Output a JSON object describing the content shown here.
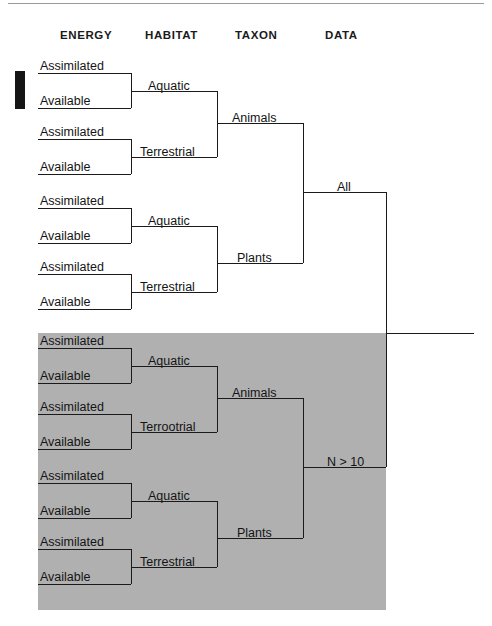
{
  "figure": {
    "width": 492,
    "height": 626,
    "shade_color": "#b0b0b0",
    "line_color": "#1a1a1a",
    "background": "#ffffff"
  },
  "headers": [
    {
      "label": "ENERGY",
      "x": 60,
      "y": 29
    },
    {
      "label": "HABITAT",
      "x": 145,
      "y": 29
    },
    {
      "label": "TAXON",
      "x": 235,
      "y": 29
    },
    {
      "label": "DATA",
      "x": 325,
      "y": 29
    }
  ],
  "marker": {
    "name": "highlight-bar",
    "x": 15,
    "y": 71,
    "w": 10,
    "h": 38
  },
  "shaded_region": {
    "x": 38,
    "y": 333,
    "w": 348,
    "h": 277
  },
  "tree": {
    "root": {
      "label": "All",
      "data_subset": "All"
    },
    "second_root": {
      "label": "N > 10",
      "data_subset": "N > 10"
    },
    "taxon_labels": [
      "Animals",
      "Plants"
    ],
    "habitat_labels": [
      "Aquatic",
      "Terrestrial"
    ],
    "energy_labels": [
      "Assimilated",
      "Available"
    ]
  },
  "nodes": {
    "data_all": {
      "label": "All",
      "x": 337,
      "y": 183
    },
    "data_n10": {
      "label": "N > 10",
      "x": 327,
      "y": 458
    },
    "taxon_animals_top": {
      "label": "Animals",
      "x": 232,
      "y": 114
    },
    "taxon_plants_top": {
      "label": "Plants",
      "x": 237,
      "y": 254
    },
    "taxon_animals_bot": {
      "label": "Animals",
      "x": 232,
      "y": 389
    },
    "taxon_plants_bot": {
      "label": "Plants",
      "x": 237,
      "y": 529
    },
    "habitat_aquatic_1": {
      "label": "Aquatic",
      "x": 148,
      "y": 82
    },
    "habitat_terrestrial_1": {
      "label": "Terrestrial",
      "x": 140,
      "y": 148
    },
    "habitat_aquatic_2": {
      "label": "Aquatic",
      "x": 148,
      "y": 217
    },
    "habitat_terrestrial_2": {
      "label": "Terrestrial",
      "x": 140,
      "y": 283
    },
    "habitat_aquatic_3": {
      "label": "Aquatic",
      "x": 148,
      "y": 357
    },
    "habitat_terrestrial_3": {
      "label": "Terrootrial",
      "x": 140,
      "y": 423
    },
    "habitat_aquatic_4": {
      "label": "Aquatic",
      "x": 148,
      "y": 492
    },
    "habitat_terrestrial_4": {
      "label": "Terrestrial",
      "x": 140,
      "y": 558
    }
  },
  "leaves": [
    {
      "label": "Assimilated",
      "x": 40,
      "y": 62,
      "line_y": 73,
      "name": "leaf-assimilated-1"
    },
    {
      "label": "Available",
      "x": 40,
      "y": 97,
      "line_y": 108,
      "name": "leaf-available-1"
    },
    {
      "label": "Assimilated",
      "x": 40,
      "y": 128,
      "line_y": 139,
      "name": "leaf-assimilated-2"
    },
    {
      "label": "Available",
      "x": 40,
      "y": 163,
      "line_y": 174,
      "name": "leaf-available-2"
    },
    {
      "label": "Assimilated",
      "x": 40,
      "y": 197,
      "line_y": 208,
      "name": "leaf-assimilated-3"
    },
    {
      "label": "Available",
      "x": 40,
      "y": 232,
      "line_y": 243,
      "name": "leaf-available-3"
    },
    {
      "label": "Assimilated",
      "x": 40,
      "y": 263,
      "line_y": 274,
      "name": "leaf-assimilated-4"
    },
    {
      "label": "Available",
      "x": 40,
      "y": 298,
      "line_y": 309,
      "name": "leaf-available-4"
    },
    {
      "label": "Assimilated",
      "x": 40,
      "y": 337,
      "line_y": 348,
      "name": "leaf-assimilated-5"
    },
    {
      "label": "Available",
      "x": 40,
      "y": 372,
      "line_y": 383,
      "name": "leaf-available-5"
    },
    {
      "label": "Assimilated",
      "x": 40,
      "y": 403,
      "line_y": 414,
      "name": "leaf-assimilated-6"
    },
    {
      "label": "Available",
      "x": 40,
      "y": 438,
      "line_y": 449,
      "name": "leaf-available-6"
    },
    {
      "label": "Assimilated",
      "x": 40,
      "y": 472,
      "line_y": 483,
      "name": "leaf-assimilated-7"
    },
    {
      "label": "Available",
      "x": 40,
      "y": 507,
      "line_y": 518,
      "name": "leaf-available-7"
    },
    {
      "label": "Assimilated",
      "x": 40,
      "y": 538,
      "line_y": 549,
      "name": "leaf-assimilated-8"
    },
    {
      "label": "Available",
      "x": 40,
      "y": 573,
      "line_y": 584,
      "name": "leaf-available-8"
    }
  ],
  "geometry": {
    "leaf_x_start": 38,
    "leaf_x_end": 131,
    "habitat_x_end": 217,
    "taxon_x_end": 303,
    "root_x": 386,
    "stub_x_end": 474,
    "stub_y": 333
  }
}
